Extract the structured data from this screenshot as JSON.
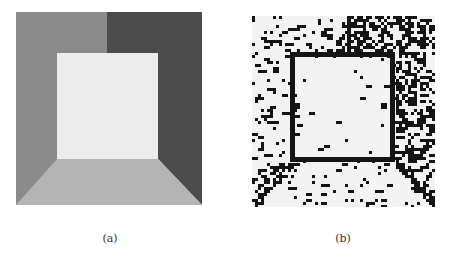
{
  "figure": {
    "panels": [
      {
        "id": "a",
        "caption": "(a)",
        "description": "Synthetic grayscale image of a box interior (room view)",
        "regions": {
          "left_wall": "#8b8b8b",
          "top_left_ceiling": "#8f8f8f",
          "top_right_ceiling": "#505050",
          "right_wall": "#4c4c4c",
          "back_wall": "#ececec",
          "floor": "#b4b4b4"
        }
      },
      {
        "id": "b",
        "caption": "(b)",
        "description": "Binary noisy edge/segmentation result with thick square frame",
        "colors": {
          "foreground": "#141414",
          "background": "#f3f3f3"
        },
        "grid": {
          "cols": 60,
          "rows": 62,
          "cell": 3.05
        },
        "seed": 1337
      }
    ]
  }
}
